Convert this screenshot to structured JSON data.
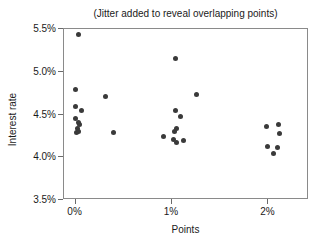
{
  "chart_data": {
    "type": "scatter",
    "title": "(Jitter added to reveal overlapping points)",
    "xlabel": "Points",
    "ylabel": "Interest rate",
    "xlim": [
      -0.12,
      2.42
    ],
    "ylim": [
      3.5,
      5.5
    ],
    "grid": false,
    "legend": null,
    "marker_color": "#3a3a3a",
    "frame_color": "#8a8a8a",
    "xticks": [
      0,
      1,
      2
    ],
    "xtick_labels": [
      "0%",
      "1%",
      "2%"
    ],
    "yticks": [
      3.5,
      4.0,
      4.5,
      5.0,
      5.5
    ],
    "ytick_labels": [
      "3.5%",
      "4.0%",
      "4.5%",
      "5.0%",
      "5.5%"
    ],
    "points": [
      {
        "x": 0.03,
        "y": 5.44
      },
      {
        "x": 0.0,
        "y": 4.79
      },
      {
        "x": 0.0,
        "y": 4.59
      },
      {
        "x": 0.0,
        "y": 4.45
      },
      {
        "x": 0.06,
        "y": 4.55
      },
      {
        "x": 0.03,
        "y": 4.41
      },
      {
        "x": 0.04,
        "y": 4.38
      },
      {
        "x": 0.02,
        "y": 4.34
      },
      {
        "x": 0.01,
        "y": 4.29
      },
      {
        "x": 0.03,
        "y": 4.3
      },
      {
        "x": 0.31,
        "y": 4.71
      },
      {
        "x": 0.39,
        "y": 4.29
      },
      {
        "x": 1.04,
        "y": 5.15
      },
      {
        "x": 1.04,
        "y": 4.55
      },
      {
        "x": 1.09,
        "y": 4.48
      },
      {
        "x": 1.05,
        "y": 4.34
      },
      {
        "x": 1.03,
        "y": 4.3
      },
      {
        "x": 0.91,
        "y": 4.24
      },
      {
        "x": 1.02,
        "y": 4.21
      },
      {
        "x": 1.05,
        "y": 4.17
      },
      {
        "x": 1.12,
        "y": 4.2
      },
      {
        "x": 1.25,
        "y": 4.73
      },
      {
        "x": 1.98,
        "y": 4.36
      },
      {
        "x": 2.1,
        "y": 4.38
      },
      {
        "x": 2.11,
        "y": 4.28
      },
      {
        "x": 1.99,
        "y": 4.12
      },
      {
        "x": 2.09,
        "y": 4.11
      },
      {
        "x": 2.05,
        "y": 4.04
      }
    ]
  }
}
